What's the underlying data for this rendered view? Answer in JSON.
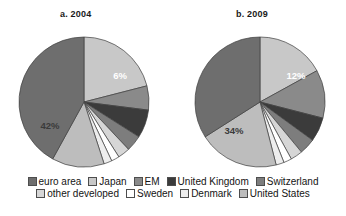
{
  "figure": {
    "charts": [
      {
        "id": "a",
        "title": "a. 2004"
      },
      {
        "id": "b",
        "title": "b. 2009"
      }
    ]
  },
  "legend": {
    "rows": [
      [
        {
          "label": "euro area",
          "color": "#6e6e6e"
        },
        {
          "label": "Japan",
          "color": "#c8c8c8"
        },
        {
          "label": "EM",
          "color": "#8a8a8a"
        },
        {
          "label": "United Kingdom",
          "color": "#3b3b3b"
        },
        {
          "label": "Switzerland",
          "color": "#7d7d7d"
        }
      ],
      [
        {
          "label": "other developed",
          "color": "#d6d6d6"
        },
        {
          "label": "Sweden",
          "color": "#ffffff"
        },
        {
          "label": "Denmark",
          "color": "#ededed"
        },
        {
          "label": "United States",
          "color": "#bdbdbd"
        }
      ]
    ]
  },
  "chart_data": [
    {
      "type": "pie",
      "title": "a. 2004",
      "categories": [
        "Japan",
        "EM",
        "United Kingdom",
        "Switzerland",
        "other developed",
        "Sweden",
        "Denmark",
        "United States",
        "euro area"
      ],
      "values": [
        21,
        6,
        7,
        4,
        3,
        2,
        2,
        13,
        42
      ],
      "colors": [
        "#c8c8c8",
        "#8a8a8a",
        "#3b3b3b",
        "#7d7d7d",
        "#d6d6d6",
        "#ffffff",
        "#ededed",
        "#bdbdbd",
        "#6e6e6e"
      ],
      "labels": [
        {
          "category": "EM",
          "text": "6%",
          "x": 104,
          "y": 45,
          "tone": "light"
        },
        {
          "category": "euro area",
          "text": "42%",
          "x": 34,
          "y": 95,
          "tone": "dark"
        }
      ],
      "legend_position": "bottom",
      "grid": false
    },
    {
      "type": "pie",
      "title": "b. 2009",
      "categories": [
        "Japan",
        "EM",
        "United Kingdom",
        "Switzerland",
        "other developed",
        "Sweden",
        "Denmark",
        "United States",
        "euro area"
      ],
      "values": [
        17,
        12,
        6,
        4,
        3,
        2,
        2,
        20,
        34
      ],
      "colors": [
        "#c8c8c8",
        "#8a8a8a",
        "#3b3b3b",
        "#7d7d7d",
        "#d6d6d6",
        "#ffffff",
        "#ededed",
        "#bdbdbd",
        "#6e6e6e"
      ],
      "labels": [
        {
          "category": "EM",
          "text": "12%",
          "x": 104,
          "y": 45,
          "tone": "light"
        },
        {
          "category": "euro area",
          "text": "34%",
          "x": 42,
          "y": 100,
          "tone": "dark"
        }
      ],
      "legend_position": "bottom",
      "grid": false
    }
  ]
}
